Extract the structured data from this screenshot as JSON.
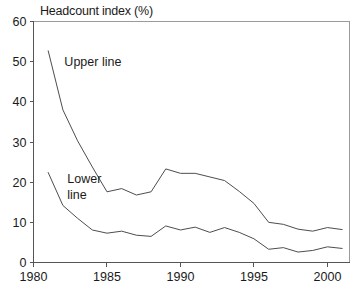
{
  "chart_data": {
    "type": "line",
    "title": "Headcount index (%)",
    "xlabel": "",
    "ylabel": "",
    "xlim": [
      1980,
      2001.5
    ],
    "ylim": [
      0,
      60
    ],
    "xticks": [
      1980,
      1985,
      1990,
      1995,
      2000
    ],
    "yticks": [
      0,
      10,
      20,
      30,
      40,
      50,
      60
    ],
    "grid": false,
    "legend_position": "inline-annotation",
    "x": [
      1981,
      1982,
      1983,
      1984,
      1985,
      1986,
      1987,
      1988,
      1989,
      1990,
      1991,
      1992,
      1993,
      1994,
      1995,
      1996,
      1997,
      1998,
      1999,
      2000,
      2001
    ],
    "series": [
      {
        "name": "Upper line",
        "values": [
          52.7,
          38.0,
          30.3,
          23.8,
          17.6,
          18.4,
          16.8,
          17.6,
          23.3,
          22.2,
          22.2,
          21.3,
          20.4,
          17.7,
          14.7,
          10.0,
          9.5,
          8.3,
          7.8,
          8.7,
          8.2
        ]
      },
      {
        "name": "Lower line",
        "values": [
          22.4,
          14.2,
          11.0,
          8.1,
          7.3,
          7.8,
          6.8,
          6.5,
          9.1,
          8.1,
          8.8,
          7.5,
          8.7,
          7.5,
          5.9,
          3.3,
          3.7,
          2.6,
          3.0,
          3.9,
          3.5
        ]
      }
    ],
    "annotations": [
      {
        "text": "Upper line",
        "x": 1982.1,
        "y": 50.0
      },
      {
        "text": "Lower",
        "x": 1982.3,
        "y": 21.0
      },
      {
        "text": "line",
        "x": 1982.3,
        "y": 17.0
      }
    ],
    "colors": {
      "line": "#4d4d4d",
      "axis": "#555555",
      "frame": "#9a9a9a",
      "text": "#1a1a1a",
      "background": "#ffffff"
    }
  }
}
